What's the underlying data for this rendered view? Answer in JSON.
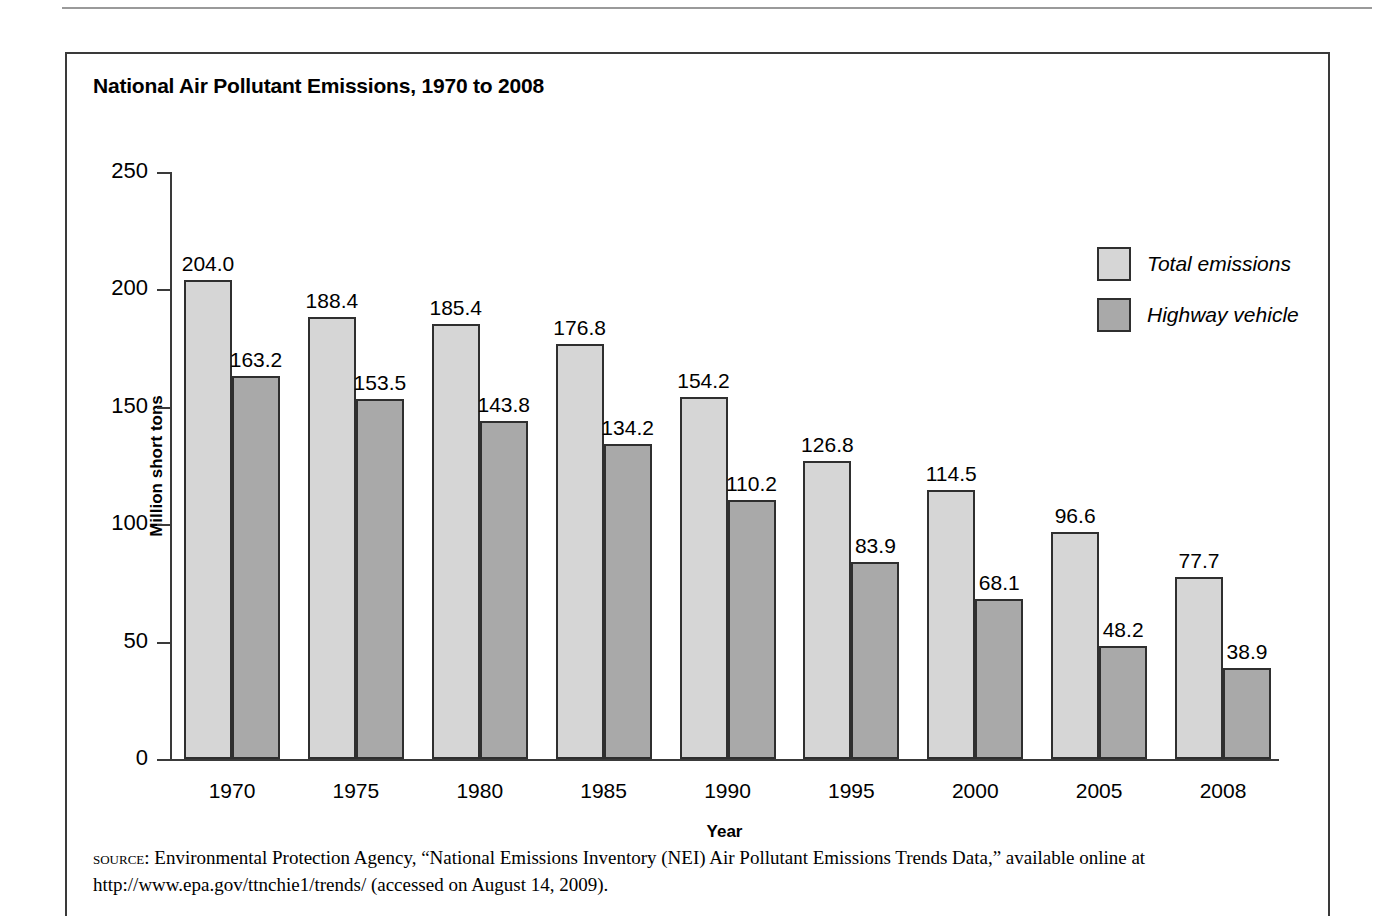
{
  "figure": {
    "title": "National Air Pollutant Emissions, 1970 to 2008",
    "source_label": "SOURCE:",
    "source_text": " Environmental Protection Agency, “National Emissions Inventory (NEI) Air Pollutant Emissions Trends Data,” available online at http://www.epa.gov/ttnchie1/trends/ (accessed on August 14, 2009)."
  },
  "legend": {
    "position": "top-right",
    "items": [
      {
        "label": "Total emissions",
        "color": "#d6d6d6"
      },
      {
        "label": "Highway vehicle",
        "color": "#a9a9a9"
      }
    ]
  },
  "axes": {
    "y_ticks": [
      "250",
      "200",
      "150",
      "100",
      "50",
      "0"
    ],
    "x_ticks": [
      "1970",
      "1975",
      "1980",
      "1985",
      "1990",
      "1995",
      "2000",
      "2005",
      "2008"
    ]
  },
  "chart_data": {
    "type": "bar",
    "title": "National Air Pollutant Emissions, 1970 to 2008",
    "xlabel": "Year",
    "ylabel": "Million short tons",
    "ylim": [
      0,
      250
    ],
    "ytick_values": [
      0,
      50,
      100,
      150,
      200,
      250
    ],
    "grid": false,
    "legend_position": "top-right",
    "categories": [
      "1970",
      "1975",
      "1980",
      "1985",
      "1990",
      "1995",
      "2000",
      "2005",
      "2008"
    ],
    "series": [
      {
        "name": "Total emissions",
        "color": "#d6d6d6",
        "values": [
          204.0,
          188.4,
          185.4,
          176.8,
          154.2,
          126.8,
          114.5,
          96.6,
          77.7
        ],
        "labels": [
          "204.0",
          "188.4",
          "185.4",
          "176.8",
          "154.2",
          "126.8",
          "114.5",
          "96.6",
          "77.7"
        ]
      },
      {
        "name": "Highway vehicle",
        "color": "#a9a9a9",
        "values": [
          163.2,
          153.5,
          143.8,
          134.2,
          110.2,
          83.9,
          68.1,
          48.2,
          38.9
        ],
        "labels": [
          "163.2",
          "153.5",
          "143.8",
          "134.2",
          "110.2",
          "83.9",
          "68.1",
          "48.2",
          "38.9"
        ]
      }
    ]
  }
}
